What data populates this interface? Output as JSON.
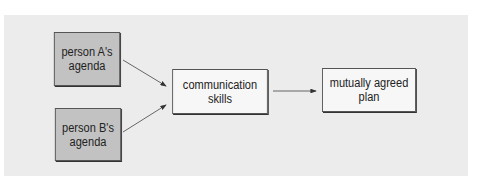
{
  "diagram": {
    "nodes": [
      {
        "id": "a",
        "label_line1": "person A's",
        "label_line2": "agenda"
      },
      {
        "id": "b",
        "label_line1": "person B's",
        "label_line2": "agenda"
      },
      {
        "id": "comm",
        "label_line1": "communication",
        "label_line2": "skills"
      },
      {
        "id": "plan",
        "label_line1": "mutually agreed",
        "label_line2": "plan"
      }
    ],
    "edges": [
      {
        "from": "a",
        "to": "comm"
      },
      {
        "from": "b",
        "to": "comm"
      },
      {
        "from": "comm",
        "to": "plan"
      }
    ],
    "colors": {
      "panel": "#ececec",
      "input_box": "#c2c2c2",
      "process_box": "#f7f7f7"
    }
  }
}
